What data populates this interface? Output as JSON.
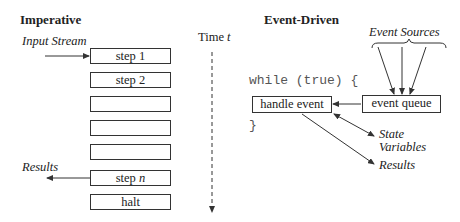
{
  "imperative": {
    "title": "Imperative",
    "input_label": "Input Stream",
    "results_label": "Results",
    "steps": [
      "step 1",
      "step 2",
      "",
      "",
      "",
      "step n",
      "halt"
    ]
  },
  "time_axis": {
    "label": "Time",
    "var": "t"
  },
  "event_driven": {
    "title": "Event-Driven",
    "sources_label": "Event Sources",
    "loop_open": "while (true) {",
    "loop_close": "}",
    "handler_box": "handle event",
    "queue_box": "event queue",
    "state_label_1": "State",
    "state_label_2": "Variables",
    "results_label": "Results"
  }
}
